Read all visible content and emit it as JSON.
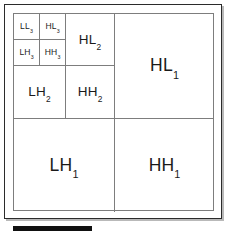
{
  "figure": {
    "type": "diagram",
    "levels": 3,
    "colors": {
      "outer_frame": "#2b2b2b",
      "inner_border": "#7d7d7d",
      "divider": "#7d7d7d",
      "label_text": "#1a1a1a",
      "background": "#ffffff",
      "scale_bar": "#111111"
    }
  },
  "subbands": {
    "level3": [
      {
        "key": "ll3",
        "band": "LL",
        "level": "3",
        "name": "approximation-ll3"
      },
      {
        "key": "hl3",
        "band": "HL",
        "level": "3",
        "name": "horizontal-detail-hl3"
      },
      {
        "key": "lh3",
        "band": "LH",
        "level": "3",
        "name": "vertical-detail-lh3"
      },
      {
        "key": "hh3",
        "band": "HH",
        "level": "3",
        "name": "diagonal-detail-hh3"
      }
    ],
    "level2": [
      {
        "key": "hl2",
        "band": "HL",
        "level": "2",
        "name": "horizontal-detail-hl2"
      },
      {
        "key": "lh2",
        "band": "LH",
        "level": "2",
        "name": "vertical-detail-lh2"
      },
      {
        "key": "hh2",
        "band": "HH",
        "level": "2",
        "name": "diagonal-detail-hh2"
      }
    ],
    "level1": [
      {
        "key": "hl1",
        "band": "HL",
        "level": "1",
        "name": "horizontal-detail-hl1"
      },
      {
        "key": "lh1",
        "band": "LH",
        "level": "1",
        "name": "vertical-detail-lh1"
      },
      {
        "key": "hh1",
        "band": "HH",
        "level": "1",
        "name": "diagonal-detail-hh1"
      }
    ]
  },
  "labels": {
    "ll3": {
      "band": "LL",
      "sub": "3"
    },
    "hl3": {
      "band": "HL",
      "sub": "3"
    },
    "lh3": {
      "band": "LH",
      "sub": "3"
    },
    "hh3": {
      "band": "HH",
      "sub": "3"
    },
    "hl2": {
      "band": "HL",
      "sub": "2"
    },
    "lh2": {
      "band": "LH",
      "sub": "2"
    },
    "hh2": {
      "band": "HH",
      "sub": "2"
    },
    "hl1": {
      "band": "HL",
      "sub": "1"
    },
    "lh1": {
      "band": "LH",
      "sub": "1"
    },
    "hh1": {
      "band": "HH",
      "sub": "1"
    }
  },
  "scale_bar": {
    "visible": true,
    "label": ""
  }
}
